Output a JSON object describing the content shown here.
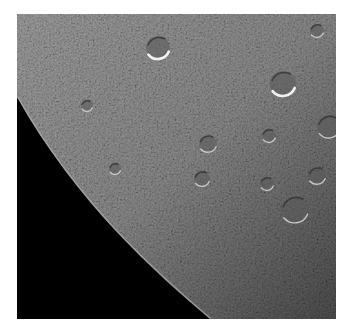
{
  "image": {
    "subject": "Cratered surface of a moon near its limb against black space",
    "frame": {
      "x": 17,
      "y": 14,
      "width": 319,
      "height": 305
    },
    "colors": {
      "background": "#ffffff",
      "space": "#000000",
      "surface_mid": "#8a8a8a",
      "surface_dark": "#5c5c5c",
      "highlight": "#e8e8e8"
    },
    "craters": [
      {
        "cx": 141,
        "cy": 34,
        "r": 12,
        "bright_rim": true
      },
      {
        "cx": 266,
        "cy": 70,
        "r": 13,
        "bright_rim": true
      },
      {
        "cx": 312,
        "cy": 113,
        "r": 12,
        "bright_rim": false
      },
      {
        "cx": 191,
        "cy": 130,
        "r": 9,
        "bright_rim": false
      },
      {
        "cx": 252,
        "cy": 122,
        "r": 7,
        "bright_rim": false
      },
      {
        "cx": 278,
        "cy": 196,
        "r": 14,
        "bright_rim": false
      },
      {
        "cx": 300,
        "cy": 162,
        "r": 9,
        "bright_rim": false
      },
      {
        "cx": 185,
        "cy": 165,
        "r": 8,
        "bright_rim": false
      },
      {
        "cx": 250,
        "cy": 170,
        "r": 7,
        "bright_rim": false
      },
      {
        "cx": 70,
        "cy": 92,
        "r": 6,
        "bright_rim": false
      },
      {
        "cx": 300,
        "cy": 17,
        "r": 7,
        "bright_rim": false
      },
      {
        "cx": 98,
        "cy": 155,
        "r": 6,
        "bright_rim": false
      }
    ]
  }
}
